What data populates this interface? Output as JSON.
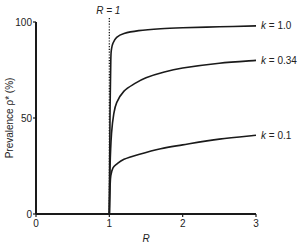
{
  "chart_data": {
    "type": "line",
    "title": "",
    "xlabel": "R",
    "ylabel": "Prevalence ρ* (%)",
    "xlim": [
      0,
      3
    ],
    "ylim": [
      0,
      100
    ],
    "x_ticks": [
      "0",
      "1",
      "2",
      "3"
    ],
    "y_ticks": [
      "0",
      "50",
      "100"
    ],
    "grid": false,
    "annotations": [
      {
        "text": "R = 1",
        "x": 1,
        "style": "dotted vertical line"
      }
    ],
    "baseline": {
      "x": [
        0,
        1
      ],
      "y": [
        0,
        0
      ]
    },
    "series": [
      {
        "name": "k = 1.0",
        "x": [
          1.0,
          1.01,
          1.02,
          1.03,
          1.05,
          1.1,
          1.2,
          1.4,
          1.7,
          2.0,
          2.5,
          3.0
        ],
        "y": [
          0,
          55,
          80,
          86,
          89,
          92,
          94,
          95.5,
          96.5,
          97,
          97.5,
          98
        ]
      },
      {
        "name": "k = 0.34",
        "x": [
          1.0,
          1.01,
          1.03,
          1.06,
          1.1,
          1.2,
          1.35,
          1.5,
          1.75,
          2.0,
          2.5,
          3.0
        ],
        "y": [
          0,
          25,
          42,
          52,
          58,
          64,
          68,
          71,
          74,
          76,
          78.5,
          80
        ]
      },
      {
        "name": "k = 0.1",
        "x": [
          1.0,
          1.01,
          1.02,
          1.05,
          1.1,
          1.2,
          1.4,
          1.7,
          2.0,
          2.5,
          3.0
        ],
        "y": [
          0,
          14,
          20,
          24,
          26,
          28.5,
          31,
          34,
          36,
          39,
          41
        ]
      }
    ]
  }
}
